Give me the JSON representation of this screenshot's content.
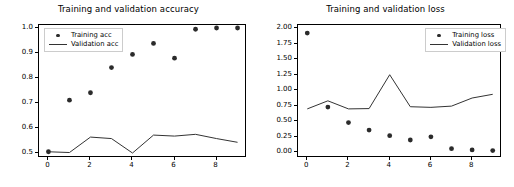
{
  "figure": {
    "width": 514,
    "height": 187,
    "background": "#ffffff"
  },
  "chart_data": [
    {
      "type": "scatter",
      "title": "Training and validation accuracy",
      "xlabel": "",
      "ylabel": "",
      "x": [
        0,
        1,
        2,
        3,
        4,
        5,
        6,
        7,
        8,
        9
      ],
      "xlim": [
        -0.45,
        9.45
      ],
      "ylim": [
        0.478,
        1.012
      ],
      "xticks": [
        0,
        2,
        4,
        6,
        8
      ],
      "xticklabels": [
        "0",
        "2",
        "4",
        "6",
        "8"
      ],
      "yticks": [
        0.5,
        0.6,
        0.7,
        0.8,
        0.9,
        1.0
      ],
      "yticklabels": [
        "0.5",
        "0.6",
        "0.7",
        "0.8",
        "0.9",
        "1.0"
      ],
      "grid": false,
      "legend_position": "upper left",
      "series": [
        {
          "name": "Training acc",
          "style": "markers",
          "marker": "o",
          "color": "#2b2b2b",
          "values": [
            0.503,
            0.71,
            0.74,
            0.841,
            0.894,
            0.938,
            0.879,
            0.995,
            1.0,
            1.0
          ]
        },
        {
          "name": "Validation acc",
          "style": "line",
          "color": "#333333",
          "values": [
            0.503,
            0.5,
            0.562,
            0.556,
            0.498,
            0.57,
            0.566,
            0.573,
            0.556,
            0.541
          ]
        }
      ]
    },
    {
      "type": "scatter",
      "title": "Training and validation loss",
      "xlabel": "",
      "ylabel": "",
      "x": [
        0,
        1,
        2,
        3,
        4,
        5,
        6,
        7,
        8,
        9
      ],
      "xlim": [
        -0.45,
        9.45
      ],
      "ylim": [
        -0.09,
        2.05
      ],
      "xticks": [
        0,
        2,
        4,
        6,
        8
      ],
      "xticklabels": [
        "0",
        "2",
        "4",
        "6",
        "8"
      ],
      "yticks": [
        0.0,
        0.25,
        0.5,
        0.75,
        1.0,
        1.25,
        1.5,
        1.75,
        2.0
      ],
      "yticklabels": [
        "0.00",
        "0.25",
        "0.50",
        "0.75",
        "1.00",
        "1.25",
        "1.50",
        "1.75",
        "2.00"
      ],
      "grid": false,
      "legend_position": "upper right",
      "series": [
        {
          "name": "Training loss",
          "style": "markers",
          "marker": "o",
          "color": "#2b2b2b",
          "values": [
            1.92,
            0.73,
            0.48,
            0.36,
            0.27,
            0.2,
            0.25,
            0.06,
            0.04,
            0.03
          ]
        },
        {
          "name": "Validation loss",
          "style": "line",
          "color": "#333333",
          "values": [
            0.7,
            0.83,
            0.7,
            0.705,
            1.25,
            0.735,
            0.725,
            0.745,
            0.875,
            0.935
          ]
        }
      ]
    }
  ]
}
